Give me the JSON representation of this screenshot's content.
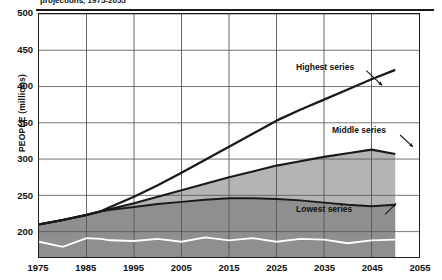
{
  "header": {
    "partial_title": "projections, 1975-2055"
  },
  "axes": {
    "ylabel": "PEOPLE (millions)",
    "yticks": [
      "500",
      "450",
      "400",
      "350",
      "300",
      "250",
      "200"
    ],
    "xticks": [
      "1975",
      "1985",
      "1995",
      "2005",
      "2015",
      "2025",
      "2035",
      "2045",
      "2055"
    ]
  },
  "annotations": {
    "highest": "Highest series",
    "middle": "Middle series",
    "lowest": "Lowest series"
  },
  "colors": {
    "line": "#1a1a1a",
    "band_upper": "#b4b4b4",
    "band_lower": "#8f8f8f",
    "inner_line": "#ffffff",
    "grid": "#555555",
    "frame": "#1d1d1d"
  },
  "chart_data": {
    "type": "area",
    "title": "projections, 1975-2055",
    "xlabel": "",
    "ylabel": "PEOPLE (millions)",
    "xlim": [
      1975,
      2055
    ],
    "ylim": [
      165,
      500
    ],
    "ytick_values": [
      200,
      250,
      300,
      350,
      400,
      450,
      500
    ],
    "xtick_values": [
      1975,
      1985,
      1995,
      2005,
      2015,
      2025,
      2035,
      2045,
      2055
    ],
    "grid": true,
    "legend": "inline-annotations",
    "x": [
      1975,
      1980,
      1985,
      1988,
      1990,
      1995,
      2000,
      2005,
      2010,
      2015,
      2020,
      2025,
      2030,
      2035,
      2040,
      2045,
      2050
    ],
    "series": [
      {
        "name": "Highest series",
        "values": [
          210,
          216,
          223,
          228,
          234,
          248,
          264,
          281,
          299,
          317,
          335,
          353,
          368,
          382,
          396,
          410,
          423
        ]
      },
      {
        "name": "Middle series",
        "values": [
          210,
          216,
          223,
          228,
          231,
          239,
          248,
          257,
          266,
          275,
          283,
          291,
          297,
          303,
          308,
          313,
          307
        ]
      },
      {
        "name": "Lowest series",
        "values": [
          210,
          216,
          223,
          228,
          230,
          234,
          238,
          241,
          244,
          246,
          246,
          245,
          243,
          240,
          237,
          235,
          237
        ]
      },
      {
        "name": "Inner white line",
        "values": [
          186,
          179,
          191,
          190,
          188,
          187,
          190,
          186,
          192,
          188,
          191,
          186,
          190,
          189,
          184,
          188,
          189
        ]
      }
    ]
  }
}
